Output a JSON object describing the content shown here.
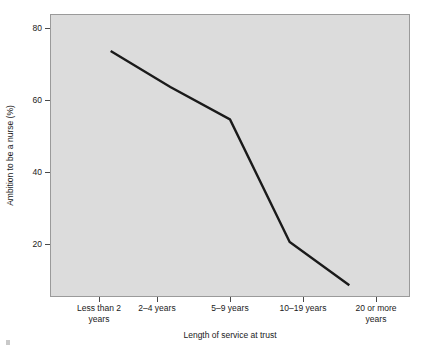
{
  "figure": {
    "background_color": "#ffffff",
    "panel_color": "#dcdcdc",
    "panel_border_color": "#9a9a9a",
    "line_color": "#1a1a1a"
  },
  "chart_data": {
    "type": "line",
    "title": "",
    "subtitle": "",
    "xlabel": "Length of service at trust",
    "ylabel": "Ambition to be a nurse (%)",
    "categories": [
      "Less than 2 years",
      "2–4 years",
      "5–9 years",
      "10–19 years",
      "20 or more years"
    ],
    "category_lines": [
      [
        "Less than 2",
        "years"
      ],
      [
        "2–4 years"
      ],
      [
        "5–9 years"
      ],
      [
        "10–19 years"
      ],
      [
        "20 or more",
        "years"
      ]
    ],
    "values": [
      74,
      64,
      55,
      21,
      9
    ],
    "yticks": [
      20,
      40,
      60,
      80
    ],
    "ytick_labels": [
      "20",
      "40",
      "60",
      "80"
    ],
    "ylim": [
      6,
      84
    ],
    "xlim": [
      0,
      6
    ],
    "grid": false,
    "legend": false,
    "legend_position": "none",
    "markers": false,
    "line_width": 2
  }
}
